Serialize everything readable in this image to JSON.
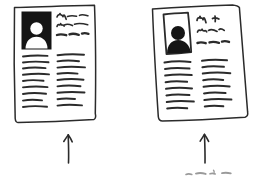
{
  "scene": {
    "title": "Two sketched document pages with upward arrows",
    "background_color": "#ffffff",
    "ink_color": "#2b2b2b",
    "photo_fill_color": "#151515",
    "width": 253,
    "height": 176
  },
  "documents": [
    {
      "id": "left",
      "label": "left-document",
      "photo": {
        "label": "photo-placeholder",
        "style": "black-box-with-white-silhouette",
        "fill": "#151515",
        "silhouette_color": "#ffffff"
      },
      "headline_lines": 3,
      "columns": [
        {
          "label": "left-column",
          "line_count": 7
        },
        {
          "label": "right-column",
          "line_count": 7
        }
      ],
      "arrow": {
        "label": "arrow-up-left",
        "direction": "up"
      }
    },
    {
      "id": "right",
      "label": "right-document",
      "photo": {
        "label": "photo-placeholder",
        "style": "white-box-with-black-silhouette",
        "fill": "#ffffff",
        "silhouette_color": "#151515"
      },
      "headline_lines": 3,
      "columns": [
        {
          "label": "left-column",
          "line_count": 7
        },
        {
          "label": "right-column",
          "line_count": 7
        }
      ],
      "arrow": {
        "label": "arrow-up-right",
        "direction": "up"
      }
    }
  ],
  "caption": {
    "label": "partial-handwritten-caption",
    "text": "",
    "note": "cut off at bottom edge"
  }
}
